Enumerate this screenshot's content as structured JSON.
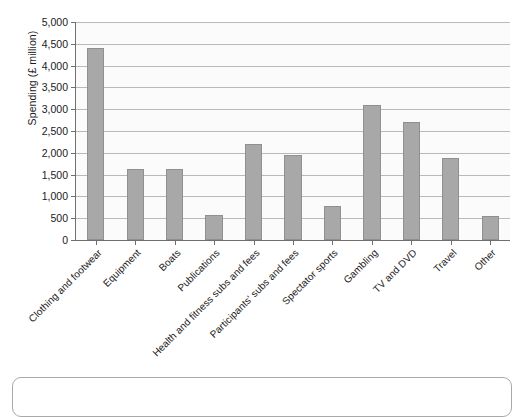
{
  "chart_data": {
    "type": "bar",
    "title": "",
    "subtitle": "",
    "xlabel": "",
    "ylabel": "Spending (£ million)",
    "ylim": [
      0,
      5000
    ],
    "ytick_step": 500,
    "ytick_labels": [
      "0",
      "500",
      "1,000",
      "1,500",
      "2,000",
      "2,500",
      "3,000",
      "3,500",
      "4,000",
      "4,500",
      "5,000"
    ],
    "ytick_values": [
      0,
      500,
      1000,
      1500,
      2000,
      2500,
      3000,
      3500,
      4000,
      4500,
      5000
    ],
    "grid": true,
    "legend": false,
    "bar_color": "#a8a8a8",
    "bar_edge_color": "#909090",
    "categories": [
      "Clothing and footwear",
      "Equipment",
      "Boats",
      "Publications",
      "Health and fitness subs and fees",
      "Participants' subs and fees",
      "Spectator sports",
      "Gambling",
      "TV and DVD",
      "Travel",
      "Other"
    ],
    "values": [
      4400,
      1620,
      1620,
      580,
      2200,
      1950,
      790,
      3100,
      2700,
      1880,
      560
    ]
  },
  "figure": {
    "background_color": "#ffffff",
    "plot_background_color": "#fbfbfb",
    "axis_color": "#6f6f6f",
    "gridline_color": "#b9b9b9"
  },
  "caption_box": {
    "label": ""
  }
}
